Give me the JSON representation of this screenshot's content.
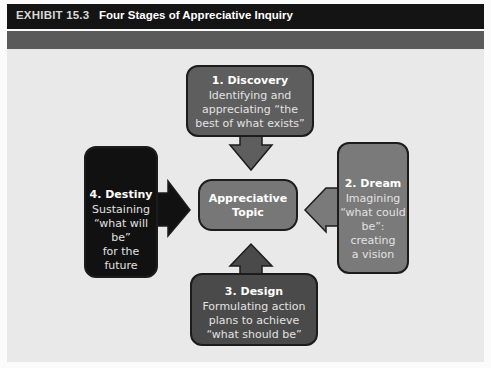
{
  "header": {
    "exhibit_number": "EXHIBIT 15.3",
    "title": "Four Stages of Appreciative Inquiry"
  },
  "diagram": {
    "center": {
      "label": "Appreciative Topic",
      "line1": "Appreciative",
      "line2": "Topic",
      "color": "#777777"
    },
    "stages": [
      {
        "id": "discovery",
        "title": "1. Discovery",
        "lines": [
          "Identifying and",
          "appreciating “the",
          "best of what exists”"
        ],
        "color": "#5e5e5e",
        "arrow_direction": "down"
      },
      {
        "id": "dream",
        "title": "2. Dream",
        "lines": [
          "Imagining",
          "“what could",
          "be”: creating",
          "a vision"
        ],
        "color": "#7a7a7a",
        "arrow_direction": "left"
      },
      {
        "id": "design",
        "title": "3. Design",
        "lines": [
          "Formulating action",
          "plans to achieve",
          "“what should be”"
        ],
        "color": "#4a4a4a",
        "arrow_direction": "up"
      },
      {
        "id": "destiny",
        "title": "4. Destiny",
        "lines": [
          "Sustaining",
          "“what will be”",
          "for the future"
        ],
        "color": "#111111",
        "arrow_direction": "right"
      }
    ]
  },
  "colors": {
    "title_bar": "#141414",
    "sub_bar": "#5a5a5a",
    "panel": "#e9e9e9"
  }
}
